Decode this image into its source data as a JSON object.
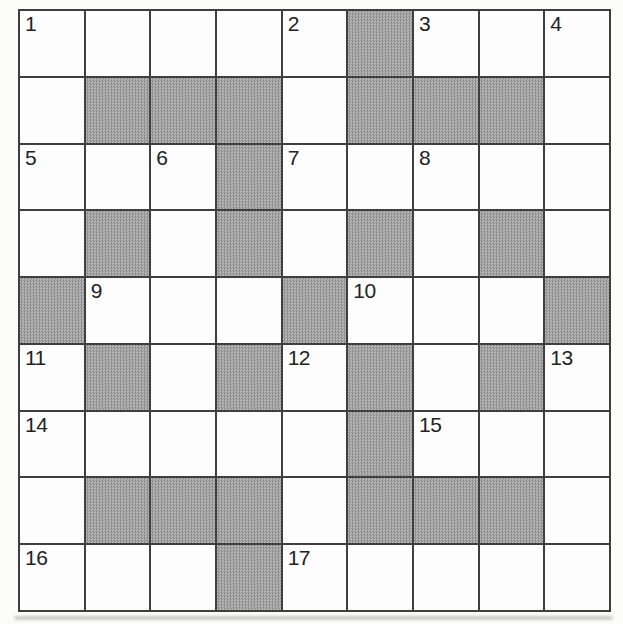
{
  "puzzle": {
    "kind": "crossword",
    "rows": 9,
    "cols": 9,
    "block_symbol": "#",
    "cells": [
      [
        "1",
        "",
        "",
        "",
        "2",
        "#",
        "3",
        "",
        "4"
      ],
      [
        "",
        "#",
        "#",
        "#",
        "",
        "#",
        "#",
        "#",
        ""
      ],
      [
        "5",
        "",
        "6",
        "#",
        "7",
        "",
        "8",
        "",
        ""
      ],
      [
        "",
        "#",
        "",
        "#",
        "",
        "#",
        "",
        "#",
        ""
      ],
      [
        "#",
        "9",
        "",
        "",
        "#",
        "10",
        "",
        "",
        "#"
      ],
      [
        "11",
        "#",
        "",
        "#",
        "12",
        "#",
        "",
        "#",
        "13"
      ],
      [
        "14",
        "",
        "",
        "",
        "",
        "#",
        "15",
        "",
        ""
      ],
      [
        "",
        "#",
        "#",
        "#",
        "",
        "#",
        "#",
        "#",
        ""
      ],
      [
        "16",
        "",
        "",
        "#",
        "17",
        "",
        "",
        "",
        ""
      ]
    ],
    "colors": {
      "paper": "#fcfcfb",
      "line": "#3f3f3f",
      "cell_white": "#fdfdfd",
      "block_base": "#a4a4a4",
      "block_dark": "#929292",
      "block_light": "#b7b7b7",
      "number": "#222222"
    }
  }
}
